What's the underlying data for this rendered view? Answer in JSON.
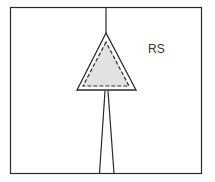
{
  "diagram": {
    "label": "RS",
    "colors": {
      "stroke": "#2a2a2a",
      "fill": "#e2e2e2",
      "background": "#ffffff"
    }
  }
}
